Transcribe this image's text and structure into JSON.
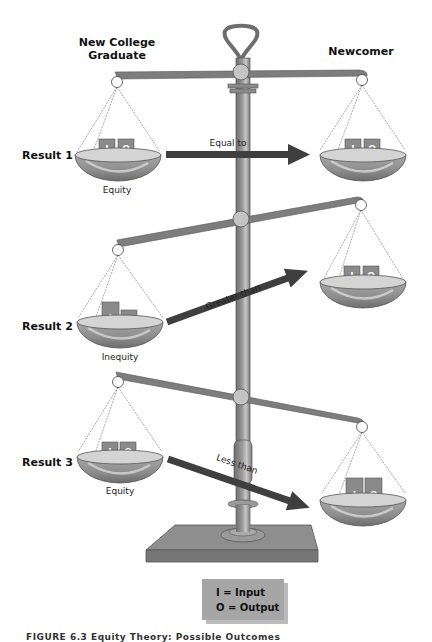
{
  "figure": {
    "title": "Equity Theory: Possible Outcomes",
    "caption": "FIGURE 6.3 Equity Theory: Possible Outcomes",
    "colors": {
      "pole": "#8c8c8c",
      "pole_dark": "#5f5f5f",
      "beam": "#7d7d7d",
      "pivot": "#c4c4c4",
      "pan_inner": "#d3d3d3",
      "pan_outer": "#9a9a9a",
      "block": "#8a8a8a",
      "arrow": "#3f3f3f",
      "legend_bg": "#a6a6a6",
      "base": "#8f8f8f"
    }
  },
  "headers": {
    "left": "New College",
    "left_line2": "Graduate",
    "right": "Newcomer"
  },
  "results": [
    {
      "label": "Result 1",
      "left_caption": "Equity",
      "comparison": "Equal to",
      "left_blocks": [
        "I",
        "O"
      ],
      "right_blocks": [
        "I",
        "O"
      ]
    },
    {
      "label": "Result 2",
      "left_caption": "Inequity",
      "comparison": "Greater than",
      "left_blocks": [
        "I",
        "O"
      ],
      "right_blocks": [
        "I",
        "O"
      ]
    },
    {
      "label": "Result 3",
      "left_caption": "Equity",
      "comparison": "Less than",
      "left_blocks": [
        "I",
        "O"
      ],
      "right_blocks": [
        "I",
        "O"
      ]
    }
  ],
  "legend": {
    "line1": "I = Input",
    "line2": "O = Output"
  }
}
